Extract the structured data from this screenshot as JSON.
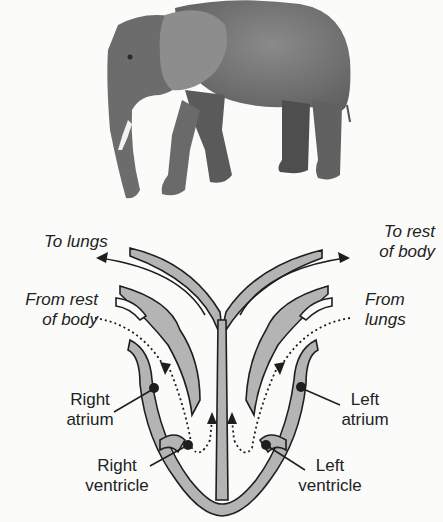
{
  "photo": {
    "subject": "elephant",
    "alt": "African elephant walking, grayscale photo"
  },
  "diagram": {
    "title": "",
    "colors": {
      "tissue": "#b4b4b4",
      "outline": "#1e1e1e",
      "background": "#fbfbfa"
    },
    "labels": {
      "to_lungs": "To lungs",
      "to_rest_1": "To rest",
      "to_rest_2": "of body",
      "from_rest_1": "From rest",
      "from_rest_2": "of body",
      "from_lungs_1": "From",
      "from_lungs_2": "lungs",
      "right_atrium_1": "Right",
      "right_atrium_2": "atrium",
      "left_atrium_1": "Left",
      "left_atrium_2": "atrium",
      "right_ventricle_1": "Right",
      "right_ventricle_2": "ventricle",
      "left_ventricle_1": "Left",
      "left_ventricle_2": "ventricle"
    }
  }
}
